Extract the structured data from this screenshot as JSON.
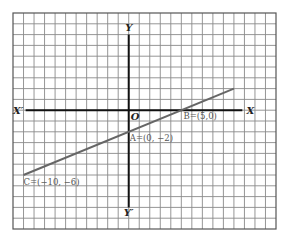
{
  "diagram": {
    "type": "coordinate-grid-with-line",
    "grid": {
      "cols": 25,
      "rows": 20,
      "origin_col": 11,
      "origin_row": 9,
      "unit_per_cell": 1,
      "grid_color": "#8a8a8a",
      "border_color": "#555555"
    },
    "axes": {
      "x_label": "X",
      "x_neg_label": "X′",
      "y_label": "Y",
      "y_neg_label": "Y′",
      "origin_label": "O",
      "x_range": [
        -10,
        10
      ],
      "y_range": [
        -7,
        8
      ],
      "axis_color": "#111111"
    },
    "line": {
      "from": [
        -10,
        -6
      ],
      "to": [
        10,
        2
      ],
      "color": "#666666"
    },
    "points": [
      {
        "name": "A",
        "label": "A=(0, −2)",
        "x": 0,
        "y": -2
      },
      {
        "name": "B",
        "label": "B=(5,0)",
        "x": 5,
        "y": 0
      },
      {
        "name": "C",
        "label": "C=(−10, −6)",
        "x": -10,
        "y": -6
      }
    ]
  }
}
